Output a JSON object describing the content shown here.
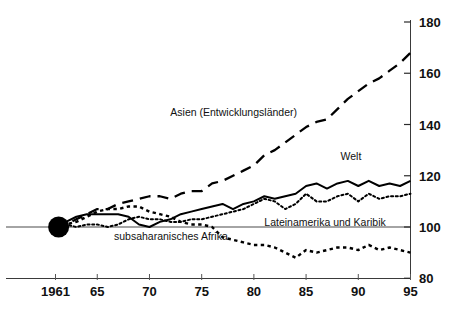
{
  "chart_data": {
    "type": "line",
    "title": "",
    "subtitle": "",
    "xlabel": "",
    "ylabel": "",
    "xlim": [
      1961,
      1995
    ],
    "ylim": [
      80,
      180
    ],
    "grid": false,
    "legend": "inline-annotations",
    "index_base": 100,
    "x_tick_labels": [
      "1961",
      "65",
      "70",
      "75",
      "80",
      "85",
      "90",
      "95"
    ],
    "x_tick_values": [
      1961,
      1965,
      1970,
      1975,
      1980,
      1985,
      1990,
      1995
    ],
    "y_tick_labels": [
      "80",
      "100",
      "120",
      "140",
      "160",
      "180"
    ],
    "y_tick_values": [
      80,
      100,
      120,
      140,
      160,
      180
    ],
    "x": [
      1961,
      1962,
      1963,
      1964,
      1965,
      1966,
      1967,
      1968,
      1969,
      1970,
      1971,
      1972,
      1973,
      1974,
      1975,
      1976,
      1977,
      1978,
      1979,
      1980,
      1981,
      1982,
      1983,
      1984,
      1985,
      1986,
      1987,
      1988,
      1989,
      1990,
      1991,
      1992,
      1993,
      1994,
      1995
    ],
    "series": [
      {
        "name": "Asien (Entwicklungsländer)",
        "style": "long-dashed",
        "label_x": 1972.0,
        "label_y": 143.5,
        "values": [
          100,
          101,
          103,
          105,
          107,
          107,
          109,
          110,
          111,
          112,
          112,
          111,
          113,
          114,
          114,
          117,
          118,
          120,
          122,
          124,
          128,
          130,
          133,
          136,
          139,
          141,
          142,
          146,
          150,
          153,
          156,
          158,
          161,
          164,
          168
        ]
      },
      {
        "name": "Welt",
        "style": "solid",
        "label_x": 1988.3,
        "label_y": 126.0,
        "values": [
          100,
          102,
          104,
          105,
          105,
          105,
          105,
          104,
          101,
          100,
          102,
          103,
          105,
          106,
          107,
          108,
          109,
          107,
          109,
          110,
          112,
          111,
          112,
          113,
          116,
          117,
          115,
          117,
          118,
          116,
          118,
          116,
          117,
          116,
          118
        ]
      },
      {
        "name": "Lateinamerika und Karibik",
        "style": "fine-dotted",
        "label_x": 1981.0,
        "label_y": 100.5,
        "values": [
          100,
          101,
          100,
          101,
          101,
          100,
          101,
          103,
          104,
          103,
          103,
          102,
          102,
          103,
          103,
          104,
          105,
          106,
          107,
          109,
          111,
          110,
          107,
          109,
          113,
          110,
          110,
          112,
          113,
          110,
          113,
          111,
          112,
          112,
          113
        ]
      },
      {
        "name": "subsaharanisches Afrika",
        "style": "dotted-dashed",
        "label_x": 1966.6,
        "label_y": 95.0,
        "values": [
          100,
          101,
          102,
          104,
          106,
          107,
          107,
          108,
          108,
          106,
          105,
          104,
          102,
          101,
          101,
          100,
          96,
          95,
          94,
          93,
          93,
          92,
          90,
          88,
          91,
          90,
          91,
          92,
          92,
          91,
          93,
          91,
          92,
          91,
          90
        ]
      }
    ],
    "origin_marker": {
      "name": "origin-dot",
      "x": 1961.3,
      "y": 100,
      "radius_px": 10.5
    }
  }
}
